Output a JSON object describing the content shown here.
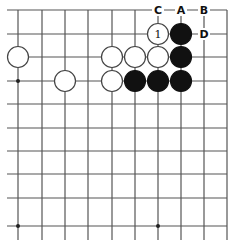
{
  "diagram": {
    "type": "go-board-fragment",
    "grid": {
      "x_lines": [
        18,
        42,
        65,
        88,
        112,
        135,
        158,
        181,
        204,
        227
      ],
      "y_lines": [
        10,
        34,
        57,
        81,
        104,
        128,
        151,
        174,
        198,
        226
      ],
      "line_color": "#555555",
      "extends_left_to": 7,
      "extends_bottom_to": 240
    },
    "star_points": [
      [
        18,
        81
      ],
      [
        18,
        226
      ],
      [
        158,
        226
      ]
    ],
    "stones": [
      {
        "color": "white",
        "x": 158,
        "y": 34,
        "label": "1"
      },
      {
        "color": "black",
        "x": 181,
        "y": 34
      },
      {
        "color": "black",
        "x": 181,
        "y": 57
      },
      {
        "color": "black",
        "x": 181,
        "y": 81
      },
      {
        "color": "white",
        "x": 18,
        "y": 57
      },
      {
        "color": "white",
        "x": 112,
        "y": 57
      },
      {
        "color": "white",
        "x": 135,
        "y": 57
      },
      {
        "color": "white",
        "x": 158,
        "y": 57
      },
      {
        "color": "white",
        "x": 65,
        "y": 81
      },
      {
        "color": "white",
        "x": 112,
        "y": 81
      },
      {
        "color": "black",
        "x": 135,
        "y": 81
      },
      {
        "color": "black",
        "x": 158,
        "y": 81
      }
    ],
    "point_labels": [
      {
        "text": "C",
        "x": 158,
        "y": 10
      },
      {
        "text": "A",
        "x": 181,
        "y": 10
      },
      {
        "text": "B",
        "x": 204,
        "y": 10
      },
      {
        "text": "D",
        "x": 204,
        "y": 34
      }
    ]
  }
}
